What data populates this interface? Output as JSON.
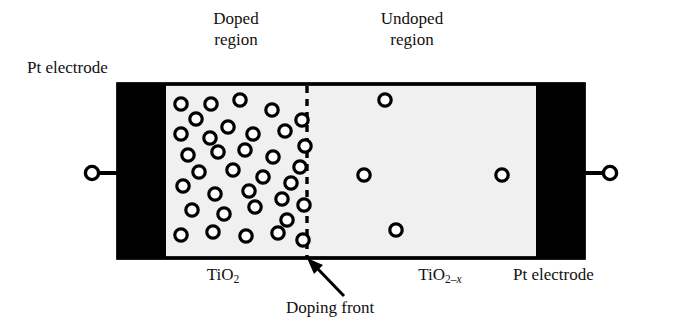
{
  "figure": {
    "labels": {
      "doped_region_line1": "Doped",
      "doped_region_line2": "region",
      "undoped_region_line1": "Undoped",
      "undoped_region_line2": "region",
      "pt_electrode_left": "Pt electrode",
      "pt_electrode_right": "Pt electrode",
      "tio2": "TiO",
      "tio2_sub": "2",
      "tio2x": "TiO",
      "tio2x_sub_num": "2",
      "tio2x_sub_minus": "–",
      "tio2x_sub_var": "x",
      "doping_front": "Doping front"
    },
    "colors": {
      "electrode_fill": "#000000",
      "body_fill": "#f0f0f0",
      "outline": "#000000",
      "dopant_ring": "#000000",
      "dopant_core": "#ffffff",
      "background": "#ffffff",
      "text": "#111111"
    },
    "geometry": {
      "body": {
        "x": 118,
        "y": 84,
        "width": 466,
        "height": 174
      },
      "left_electrode": {
        "x": 118,
        "y": 84,
        "width": 48,
        "height": 174
      },
      "right_electrode": {
        "x": 536,
        "y": 84,
        "width": 48,
        "height": 174
      },
      "doping_front_x": 307,
      "doping_front_y1": 86,
      "doping_front_y2": 257,
      "left_terminal": {
        "cx": 92,
        "cy": 173,
        "r": 7,
        "lead_to_x": 118
      },
      "right_terminal": {
        "cx": 610,
        "cy": 173,
        "r": 7,
        "lead_from_x": 584
      },
      "arrow": {
        "x1": 344,
        "y1": 296,
        "x2": 309,
        "y2": 260
      },
      "dopant_radius": 6.2,
      "dopant_ring_width": 3.2
    },
    "dopants_doped_region": [
      [
        181,
        104
      ],
      [
        211,
        104
      ],
      [
        240,
        100
      ],
      [
        272,
        110
      ],
      [
        302,
        120
      ],
      [
        196,
        119
      ],
      [
        228,
        127
      ],
      [
        181,
        134
      ],
      [
        210,
        138
      ],
      [
        253,
        134
      ],
      [
        285,
        131
      ],
      [
        305,
        146
      ],
      [
        188,
        155
      ],
      [
        218,
        152
      ],
      [
        245,
        150
      ],
      [
        273,
        157
      ],
      [
        300,
        167
      ],
      [
        199,
        172
      ],
      [
        233,
        170
      ],
      [
        263,
        177
      ],
      [
        291,
        183
      ],
      [
        183,
        186
      ],
      [
        215,
        194
      ],
      [
        249,
        191
      ],
      [
        282,
        199
      ],
      [
        304,
        205
      ],
      [
        192,
        210
      ],
      [
        224,
        214
      ],
      [
        255,
        207
      ],
      [
        287,
        220
      ],
      [
        181,
        235
      ],
      [
        213,
        232
      ],
      [
        246,
        236
      ],
      [
        278,
        233
      ],
      [
        303,
        240
      ]
    ],
    "dopants_undoped_region": [
      [
        385,
        100
      ],
      [
        364,
        175
      ],
      [
        396,
        230
      ],
      [
        502,
        175
      ]
    ]
  }
}
